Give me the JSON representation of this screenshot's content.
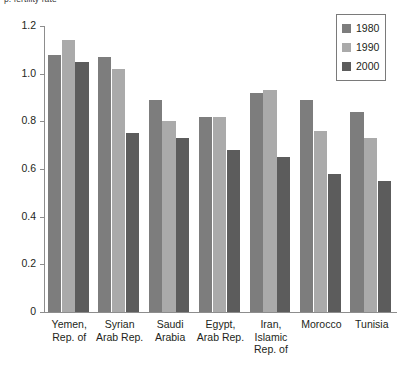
{
  "chart_data": {
    "type": "bar",
    "title": "p. fertility rate",
    "xlabel": "",
    "ylabel": "",
    "ylim": [
      0,
      1.2
    ],
    "ytick_labels": [
      "1.2",
      "1.0",
      "0.8",
      "0.6",
      "0.4",
      "0.2",
      "0"
    ],
    "ytick_values": [
      1.2,
      1.0,
      0.8,
      0.6,
      0.4,
      0.2,
      0
    ],
    "grid": false,
    "legend_position": "top-right",
    "categories": [
      "Yemen,\nRep. of",
      "Syrian\nArab Rep.",
      "Saudi\nArabia",
      "Egypt,\nArab Rep.",
      "Iran,\nIslamic\nRep. of",
      "Morocco",
      "Tunisia"
    ],
    "category_lines": [
      [
        "Yemen,",
        "Rep. of"
      ],
      [
        "Syrian",
        "Arab Rep."
      ],
      [
        "Saudi",
        "Arabia"
      ],
      [
        "Egypt,",
        "Arab Rep."
      ],
      [
        "Iran,",
        "Islamic",
        "Rep. of"
      ],
      [
        "Morocco"
      ],
      [
        "Tunisia"
      ]
    ],
    "series": [
      {
        "name": "1980",
        "color": "#7d7d7d",
        "values": [
          1.08,
          1.07,
          0.89,
          0.82,
          0.92,
          0.89,
          0.84
        ]
      },
      {
        "name": "1990",
        "color": "#aaaaaa",
        "values": [
          1.14,
          1.02,
          0.8,
          0.82,
          0.93,
          0.76,
          0.73
        ]
      },
      {
        "name": "2000",
        "color": "#5c5c5c",
        "values": [
          1.05,
          0.75,
          0.73,
          0.68,
          0.65,
          0.58,
          0.55
        ]
      }
    ]
  },
  "legend": {
    "items": [
      {
        "label": "1980",
        "swatch": "y1980"
      },
      {
        "label": "1990",
        "swatch": "y1990"
      },
      {
        "label": "2000",
        "swatch": "y2000"
      }
    ]
  }
}
